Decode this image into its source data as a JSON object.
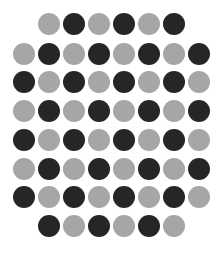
{
  "colors": {
    "dark": "#262626",
    "gray": "#a6a6a6",
    "background": "#ffffff"
  },
  "layout": {
    "diameter": 22,
    "col_spacing": 25,
    "row_y": [
      24,
      54,
      82,
      111,
      140,
      169,
      197,
      226
    ]
  },
  "rows": [
    {
      "start_x": 49,
      "dots": [
        "G",
        "D",
        "G",
        "D",
        "G",
        "D"
      ]
    },
    {
      "start_x": 24,
      "dots": [
        "G",
        "D",
        "G",
        "D",
        "G",
        "D",
        "G",
        "D"
      ]
    },
    {
      "start_x": 24,
      "dots": [
        "D",
        "G",
        "D",
        "G",
        "D",
        "G",
        "D",
        "G"
      ]
    },
    {
      "start_x": 24,
      "dots": [
        "G",
        "D",
        "G",
        "D",
        "G",
        "D",
        "G",
        "D"
      ]
    },
    {
      "start_x": 24,
      "dots": [
        "D",
        "G",
        "D",
        "G",
        "D",
        "G",
        "D",
        "G"
      ]
    },
    {
      "start_x": 24,
      "dots": [
        "G",
        "D",
        "G",
        "D",
        "G",
        "D",
        "G",
        "D"
      ]
    },
    {
      "start_x": 24,
      "dots": [
        "D",
        "G",
        "D",
        "G",
        "D",
        "G",
        "D",
        "G"
      ]
    },
    {
      "start_x": 49,
      "dots": [
        "D",
        "G",
        "D",
        "G",
        "D",
        "G"
      ]
    }
  ]
}
